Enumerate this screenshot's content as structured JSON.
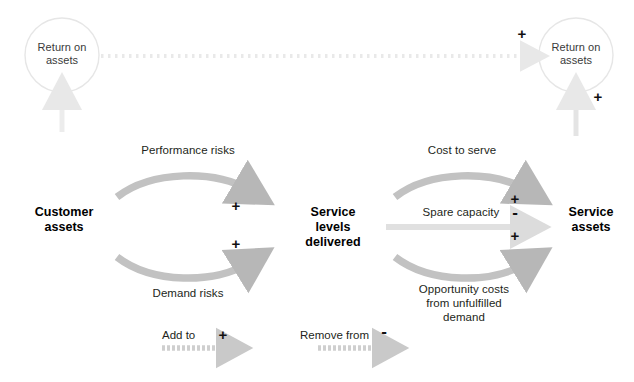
{
  "diagram": {
    "nodes": {
      "return_on_assets_left": "Return on\nassets",
      "return_on_assets_right": "Return on\nassets",
      "customer_assets": "Customer\nassets",
      "service_levels_delivered": "Service\nlevels\ndelivered",
      "service_assets": "Service\nassets"
    },
    "edge_labels": {
      "performance_risks": "Performance risks",
      "demand_risks": "Demand risks",
      "cost_to_serve": "Cost to serve",
      "spare_capacity": "Spare capacity",
      "opportunity_costs": "Opportunity costs\nfrom unfulfilled\ndemand"
    },
    "signs": {
      "performance_risks": "+",
      "demand_risks": "+",
      "cost_to_serve": "+",
      "spare_capacity": "-",
      "opportunity_costs": "+",
      "roa_link_top": "+",
      "service_assets_to_roa": "+"
    },
    "legend": {
      "add_to_label": "Add to",
      "add_to_sign": "+",
      "remove_from_label": "Remove from",
      "remove_from_sign": "-"
    },
    "colors": {
      "arrow_gray": "#b7b7b7",
      "light_gray": "#dcdcdc",
      "very_light_gray": "#ececec",
      "circle_stroke": "#e4e4e4",
      "text": "#231f20",
      "background": "#ffffff"
    }
  }
}
